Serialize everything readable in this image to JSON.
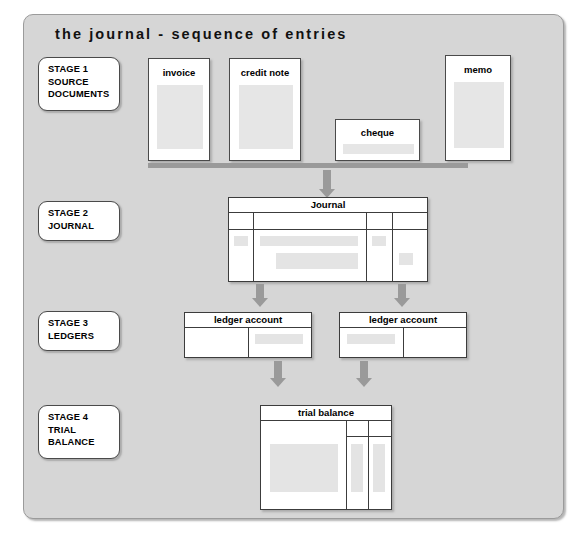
{
  "panel": {
    "title": "the journal - sequence of entries",
    "background_color": "#d6d6d6",
    "border_color": "#9b9b9b"
  },
  "stages": [
    {
      "id": "stage-1",
      "lines": [
        "STAGE 1",
        "SOURCE",
        "DOCUMENTS"
      ]
    },
    {
      "id": "stage-2",
      "lines": [
        "STAGE 2",
        "JOURNAL"
      ]
    },
    {
      "id": "stage-3",
      "lines": [
        "STAGE 3",
        "LEDGERS"
      ]
    },
    {
      "id": "stage-4",
      "lines": [
        "STAGE 4",
        "TRIAL",
        "BALANCE"
      ]
    }
  ],
  "source_documents": [
    {
      "id": "invoice",
      "label": "invoice"
    },
    {
      "id": "credit-note",
      "label": "credit note"
    },
    {
      "id": "cheque",
      "label": "cheque"
    },
    {
      "id": "memo",
      "label": "memo"
    }
  ],
  "journal": {
    "title": "Journal"
  },
  "ledgers": [
    {
      "id": "ledger-account-left",
      "title": "ledger account"
    },
    {
      "id": "ledger-account-right",
      "title": "ledger account"
    }
  ],
  "trial_balance": {
    "title": "trial balance"
  },
  "colors": {
    "panel_fill": "#d6d6d6",
    "paper_fill": "#ffffff",
    "content_band": "#e4e4e4",
    "connector": "#9a9a9a",
    "line": "#3c3c3c",
    "text": "#000000"
  }
}
